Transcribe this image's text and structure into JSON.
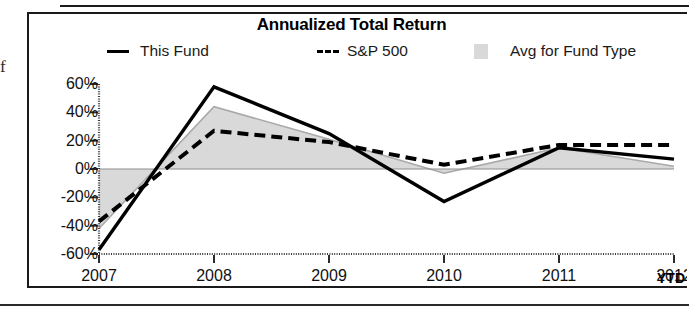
{
  "page": {
    "edge_glyph": "f"
  },
  "chart_data": {
    "type": "line",
    "title": "Annualized Total Return",
    "xlabel": "",
    "ylabel": "",
    "categories": [
      "2007",
      "2008",
      "2009",
      "2010",
      "2011",
      "2012"
    ],
    "x_tick_suffix_label": "YTD",
    "ytick_labels": [
      "60%",
      "40%",
      "20%",
      "0%",
      "-20%",
      "-40%",
      "-60%"
    ],
    "ytick_values": [
      60,
      40,
      20,
      0,
      -20,
      -40,
      -60
    ],
    "ylim": [
      -60,
      60
    ],
    "grid": false,
    "legend_position": "top",
    "series": [
      {
        "name": "This Fund",
        "style": "solid",
        "color": "#000000",
        "values": [
          -57,
          58,
          25,
          -23,
          15,
          7
        ]
      },
      {
        "name": "S&P 500",
        "style": "dashed",
        "color": "#000000",
        "values": [
          -37,
          27,
          19,
          3,
          17,
          17
        ]
      },
      {
        "name": "Avg for Fund Type",
        "style": "band",
        "color": "#d9d9d9",
        "values": [
          -42,
          44,
          21,
          -3,
          15,
          2
        ]
      }
    ]
  },
  "legend": [
    {
      "label": "This Fund",
      "marker": "solid-line-swatch"
    },
    {
      "label": "S&P 500",
      "marker": "dashed-line-swatch"
    },
    {
      "label": "Avg for Fund Type",
      "marker": "gray-band-swatch"
    }
  ]
}
